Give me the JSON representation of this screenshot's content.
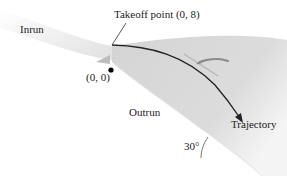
{
  "diagram": {
    "labels": {
      "inrun": "Inrun",
      "takeoff": "Takeoff point (0, 8)",
      "origin": "(0, 0)",
      "outrun": "Outrun",
      "trajectory": "Trajectory",
      "angle": "30°"
    },
    "points": {
      "takeoff": {
        "x": 0,
        "y": 8
      },
      "origin": {
        "x": 0,
        "y": 0
      }
    },
    "outrun_slope_deg": 30,
    "colors": {
      "slope_shade": "#c8c8c8",
      "trajectory": "#222222",
      "point": "#000000",
      "skier": "#8a8a8a"
    }
  }
}
